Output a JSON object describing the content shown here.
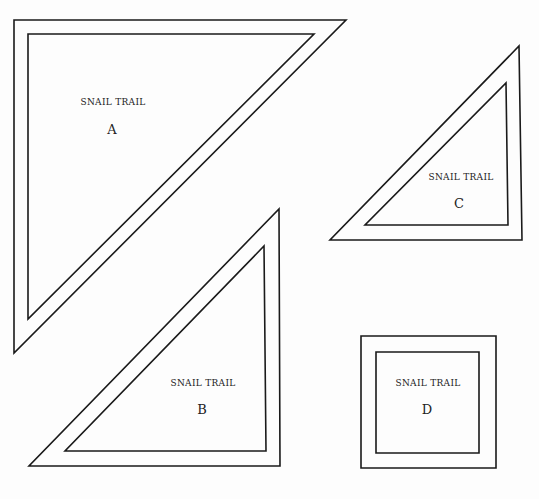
{
  "pieces": [
    {
      "id": "A",
      "title": "SNAIL TRAIL",
      "letter": "A",
      "shape": "right-triangle",
      "outer": [
        [
          14,
          20
        ],
        [
          346,
          20
        ],
        [
          14,
          353
        ]
      ],
      "inner": [
        [
          28,
          34
        ],
        [
          314,
          34
        ],
        [
          28,
          319
        ]
      ],
      "title_pos": [
        113,
        105
      ],
      "letter_pos": [
        112,
        130
      ]
    },
    {
      "id": "B",
      "title": "SNAIL TRAIL",
      "letter": "B",
      "shape": "right-triangle",
      "outer": [
        [
          279,
          209
        ],
        [
          280,
          466
        ],
        [
          29,
          466
        ]
      ],
      "inner": [
        [
          264,
          246
        ],
        [
          266,
          451
        ],
        [
          65,
          451
        ]
      ],
      "title_pos": [
        203,
        386
      ],
      "letter_pos": [
        202,
        410
      ]
    },
    {
      "id": "C",
      "title": "SNAIL TRAIL",
      "letter": "C",
      "shape": "right-triangle",
      "outer": [
        [
          519,
          46
        ],
        [
          522,
          240
        ],
        [
          330,
          240
        ]
      ],
      "inner": [
        [
          506,
          83
        ],
        [
          508,
          225
        ],
        [
          365,
          225
        ]
      ],
      "title_pos": [
        461,
        180
      ],
      "letter_pos": [
        459,
        204
      ]
    },
    {
      "id": "D",
      "title": "SNAIL TRAIL",
      "letter": "D",
      "shape": "square",
      "outer": [
        [
          361,
          336
        ],
        [
          496,
          336
        ],
        [
          496,
          468
        ],
        [
          361,
          468
        ]
      ],
      "inner": [
        [
          376,
          352
        ],
        [
          479,
          352
        ],
        [
          479,
          453
        ],
        [
          376,
          453
        ]
      ],
      "title_pos": [
        428,
        386
      ],
      "letter_pos": [
        427,
        410
      ]
    }
  ],
  "colors": {
    "stroke": "#1a1a1a",
    "background": "#fdfdfd"
  }
}
